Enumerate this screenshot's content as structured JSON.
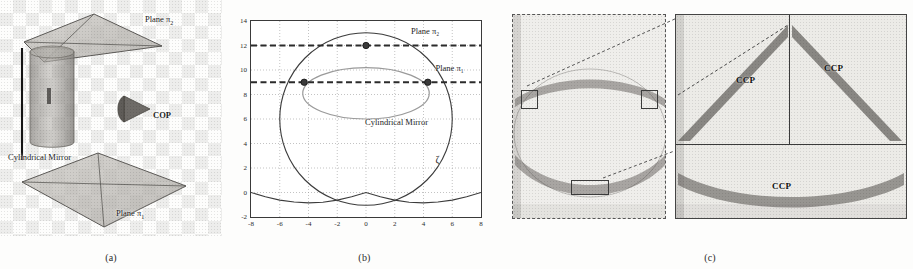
{
  "figure": {
    "panels": [
      {
        "id": "a",
        "caption": "(a)"
      },
      {
        "id": "b",
        "caption": "(b)"
      },
      {
        "id": "c",
        "caption": "(c)"
      }
    ]
  },
  "panel_a": {
    "caption": "(a)",
    "labels": {
      "plane_top": "Plane π",
      "plane_top_sub": "2",
      "plane_bottom": "Plane π",
      "plane_bottom_sub": "1",
      "mirror": "Cylindrical Mirror",
      "cop": "COP"
    }
  },
  "panel_b": {
    "caption": "(b)",
    "labels": {
      "plane_upper": "Plane π",
      "plane_upper_sub": "2",
      "plane_lower": "Plane π",
      "plane_lower_sub": "1",
      "mirror": "Cylindrical Mirror",
      "zeta": "ζ"
    }
  },
  "panel_c": {
    "caption": "(c)",
    "labels": {
      "ccp_left": "CCP",
      "ccp_right": "CCP",
      "ccp_bottom": "CCP"
    }
  },
  "chart_data": {
    "type": "line",
    "title": "",
    "xlabel": "",
    "ylabel": "",
    "xlim": [
      -8,
      8
    ],
    "ylim": [
      -2,
      14
    ],
    "xticks": [
      -8,
      -6,
      -4,
      -2,
      0,
      2,
      4,
      6,
      8
    ],
    "yticks": [
      -2,
      0,
      2,
      4,
      6,
      8,
      10,
      12,
      14
    ],
    "xtick_labels": [
      "-8",
      "-6",
      "-4",
      "-2",
      "0",
      "2",
      "4",
      "6",
      "8"
    ],
    "ytick_labels": [
      "-2",
      "0",
      "2",
      "4",
      "6",
      "8",
      "10",
      "12",
      "14"
    ],
    "grid": true,
    "grid_style": "dotted",
    "legend": "none",
    "series": [
      {
        "name": "Cylindrical Mirror (circle)",
        "style": "solid",
        "color": "#3c3c3c",
        "shape": "circle",
        "center": [
          0,
          6
        ],
        "radius": 6,
        "comment": "large circle from y=0 to y=12 centered at x=0"
      },
      {
        "name": "Caustic / reflected ellipse",
        "style": "solid",
        "color": "#9a9a9a",
        "shape": "ellipse",
        "center": [
          0,
          8.1
        ],
        "rx": 4.4,
        "ry": 2.1
      },
      {
        "name": "Lower caustic curve",
        "style": "solid",
        "color": "#3c3c3c",
        "shape": "open_curve",
        "x": [
          -8,
          -7,
          -6,
          -5,
          -4,
          -3,
          -2,
          -1,
          0,
          1,
          2,
          3,
          4,
          5,
          6,
          7,
          8
        ],
        "y": [
          0.0,
          -0.35,
          -0.62,
          -0.78,
          -0.85,
          -0.8,
          -0.62,
          -0.35,
          0.0,
          -0.35,
          -0.62,
          -0.8,
          -0.85,
          -0.78,
          -0.62,
          -0.35,
          0.0
        ]
      }
    ],
    "reference_lines": [
      {
        "name": "Plane π2",
        "axis": "horizontal",
        "value": 12,
        "style": "dashed",
        "color": "#2b2b2b"
      },
      {
        "name": "Plane π1",
        "axis": "horizontal",
        "value": 9,
        "style": "dashed",
        "color": "#2b2b2b"
      }
    ],
    "markers": [
      {
        "x": 0,
        "y": 12,
        "label": "",
        "color": "#2b2b2b"
      },
      {
        "x": -4.3,
        "y": 9,
        "label": "",
        "color": "#2b2b2b"
      },
      {
        "x": 4.3,
        "y": 9,
        "label": "",
        "color": "#2b2b2b"
      }
    ],
    "annotations": [
      {
        "text": "Plane π₂",
        "x": 3.2,
        "y": 13.0
      },
      {
        "text": "Plane π₁",
        "x": 4.9,
        "y": 10.0
      },
      {
        "text": "Cylindrical Mirror",
        "x": 0.0,
        "y": 5.6
      },
      {
        "text": "ζ",
        "x": 4.9,
        "y": 2.6
      }
    ]
  }
}
